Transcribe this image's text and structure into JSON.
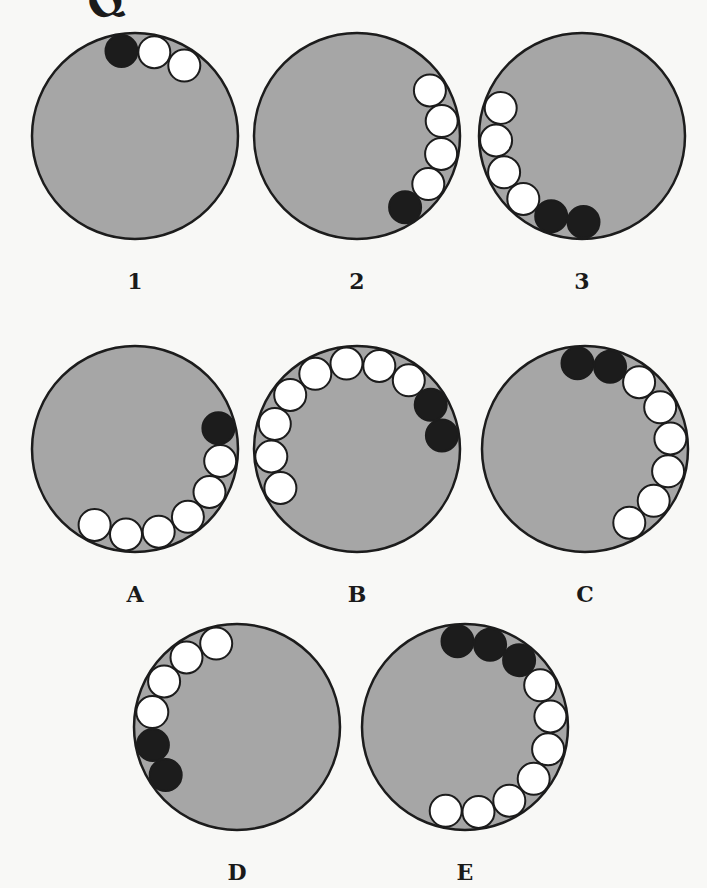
{
  "header": {
    "partial_title": "Q"
  },
  "style": {
    "disc_fill": "#a6a6a6",
    "stroke": "#1c1c1c",
    "white_ball": "#ffffff",
    "black_ball": "#1c1c1c",
    "disc_radius": 103,
    "ball_radius": 16,
    "orbit_radius": 86
  },
  "sequence": [
    {
      "label": "1",
      "cx": 135,
      "cy": 136,
      "label_y": 270,
      "balls": [
        {
          "angle": -9,
          "color": "black"
        },
        {
          "angle": 13,
          "color": "white"
        },
        {
          "angle": 35,
          "color": "white"
        }
      ]
    },
    {
      "label": "2",
      "cx": 357,
      "cy": 136,
      "label_y": 270,
      "balls": [
        {
          "angle": 58,
          "color": "white"
        },
        {
          "angle": 80,
          "color": "white"
        },
        {
          "angle": 102,
          "color": "white"
        },
        {
          "angle": 124,
          "color": "white"
        },
        {
          "angle": 146,
          "color": "black"
        }
      ]
    },
    {
      "label": "3",
      "cx": 582,
      "cy": 136,
      "label_y": 270,
      "balls": [
        {
          "angle": 289,
          "color": "white"
        },
        {
          "angle": 267,
          "color": "white"
        },
        {
          "angle": 245,
          "color": "white"
        },
        {
          "angle": 223,
          "color": "white"
        },
        {
          "angle": 201,
          "color": "black"
        },
        {
          "angle": 179,
          "color": "black"
        }
      ]
    }
  ],
  "options": [
    {
      "label": "A",
      "cx": 135,
      "cy": 449,
      "label_y": 583,
      "balls": [
        {
          "angle": 76,
          "color": "black"
        },
        {
          "angle": 98,
          "color": "white"
        },
        {
          "angle": 120,
          "color": "white"
        },
        {
          "angle": 142,
          "color": "white"
        },
        {
          "angle": 164,
          "color": "white"
        },
        {
          "angle": 186,
          "color": "white"
        },
        {
          "angle": 208,
          "color": "white"
        }
      ]
    },
    {
      "label": "B",
      "cx": 357,
      "cy": 449,
      "label_y": 583,
      "balls": [
        {
          "angle": 81,
          "color": "black"
        },
        {
          "angle": 59,
          "color": "black"
        },
        {
          "angle": 37,
          "color": "white"
        },
        {
          "angle": 15,
          "color": "white"
        },
        {
          "angle": -7,
          "color": "white"
        },
        {
          "angle": -29,
          "color": "white"
        },
        {
          "angle": -51,
          "color": "white"
        },
        {
          "angle": -73,
          "color": "white"
        },
        {
          "angle": -95,
          "color": "white"
        },
        {
          "angle": -117,
          "color": "white"
        }
      ]
    },
    {
      "label": "C",
      "cx": 585,
      "cy": 449,
      "label_y": 583,
      "balls": [
        {
          "angle": -5,
          "color": "black"
        },
        {
          "angle": 17,
          "color": "black"
        },
        {
          "angle": 39,
          "color": "white"
        },
        {
          "angle": 61,
          "color": "white"
        },
        {
          "angle": 83,
          "color": "white"
        },
        {
          "angle": 105,
          "color": "white"
        },
        {
          "angle": 127,
          "color": "white"
        },
        {
          "angle": 149,
          "color": "white"
        }
      ]
    },
    {
      "label": "D",
      "cx": 237,
      "cy": 727,
      "label_y": 861,
      "balls": [
        {
          "angle": 258,
          "color": "black"
        },
        {
          "angle": 236,
          "color": "black"
        },
        {
          "angle": 280,
          "color": "white"
        },
        {
          "angle": 302,
          "color": "white"
        },
        {
          "angle": 324,
          "color": "white"
        },
        {
          "angle": 346,
          "color": "white"
        }
      ]
    },
    {
      "label": "E",
      "cx": 465,
      "cy": 727,
      "label_y": 861,
      "balls": [
        {
          "angle": -5,
          "color": "black"
        },
        {
          "angle": 17,
          "color": "black"
        },
        {
          "angle": 39,
          "color": "black"
        },
        {
          "angle": 61,
          "color": "white"
        },
        {
          "angle": 83,
          "color": "white"
        },
        {
          "angle": 105,
          "color": "white"
        },
        {
          "angle": 127,
          "color": "white"
        },
        {
          "angle": 149,
          "color": "white"
        },
        {
          "angle": 171,
          "color": "white"
        },
        {
          "angle": 193,
          "color": "white"
        }
      ]
    }
  ]
}
